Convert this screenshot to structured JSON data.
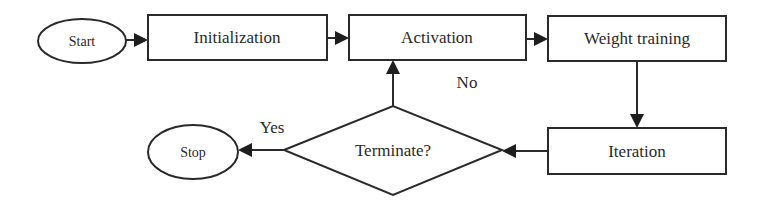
{
  "diagram": {
    "type": "flowchart",
    "nodes": {
      "start": {
        "label": "Start",
        "shape": "ellipse"
      },
      "initialization": {
        "label": "Initialization",
        "shape": "rectangle"
      },
      "activation": {
        "label": "Activation",
        "shape": "rectangle"
      },
      "weight_training": {
        "label": "Weight training",
        "shape": "rectangle"
      },
      "iteration": {
        "label": "Iteration",
        "shape": "rectangle"
      },
      "terminate": {
        "label": "Terminate?",
        "shape": "diamond"
      },
      "stop": {
        "label": "Stop",
        "shape": "ellipse"
      }
    },
    "edges": [
      {
        "from": "Start",
        "to": "Initialization",
        "label": ""
      },
      {
        "from": "Initialization",
        "to": "Activation",
        "label": ""
      },
      {
        "from": "Activation",
        "to": "Weight training",
        "label": ""
      },
      {
        "from": "Weight training",
        "to": "Iteration",
        "label": ""
      },
      {
        "from": "Iteration",
        "to": "Terminate?",
        "label": ""
      },
      {
        "from": "Terminate?",
        "to": "Activation",
        "label": "No"
      },
      {
        "from": "Terminate?",
        "to": "Stop",
        "label": "Yes"
      }
    ],
    "edge_labels": {
      "no": "No",
      "yes": "Yes"
    },
    "colors": {
      "stroke": "#2a2a2a",
      "background": "#ffffff"
    }
  }
}
